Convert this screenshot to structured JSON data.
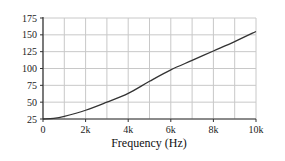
{
  "chart_data": {
    "type": "line",
    "title": "",
    "xlabel": "Frequency (Hz)",
    "ylabel": "",
    "xlim": [
      0,
      10000
    ],
    "ylim": [
      25,
      175
    ],
    "grid": true,
    "legend": null,
    "x_ticks": [
      0,
      2000,
      4000,
      6000,
      8000,
      10000
    ],
    "x_tick_labels": [
      "0",
      "2k",
      "4k",
      "6k",
      "8k",
      "10k"
    ],
    "y_ticks": [
      25,
      50,
      75,
      100,
      125,
      150,
      175
    ],
    "y_tick_labels": [
      "25",
      "50",
      "75",
      "100",
      "125",
      "150",
      "175"
    ],
    "x_minor_grid_step": 1000,
    "series": [
      {
        "name": "curve",
        "color": "#333333",
        "x": [
          0,
          500,
          1000,
          2000,
          3000,
          4000,
          5000,
          6000,
          7000,
          8000,
          9000,
          10000
        ],
        "values": [
          25,
          26,
          29,
          38,
          50,
          63,
          81,
          98,
          112,
          126,
          140,
          155
        ]
      }
    ]
  },
  "colors": {
    "grid": "#c8c8c8",
    "axis": "#333333",
    "line": "#333333",
    "background": "#ffffff"
  }
}
